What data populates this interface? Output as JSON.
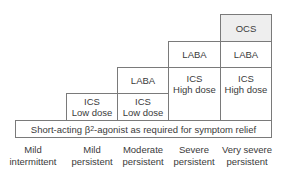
{
  "diagram": {
    "steps": [
      {
        "severity_line1": "Mild",
        "severity_line2": "intermittent",
        "treatments": []
      },
      {
        "severity_line1": "Mild",
        "severity_line2": "persistent",
        "treatments": [
          {
            "line1": "ICS",
            "line2": "Low dose"
          }
        ]
      },
      {
        "severity_line1": "Moderate",
        "severity_line2": "persistent",
        "treatments": [
          {
            "line1": "ICS",
            "line2": "Low dose"
          },
          {
            "line1": "LABA"
          }
        ]
      },
      {
        "severity_line1": "Severe",
        "severity_line2": "persistent",
        "treatments": [
          {
            "line1": "ICS",
            "line2": "High dose"
          },
          {
            "line1": "LABA"
          }
        ]
      },
      {
        "severity_line1": "Very severe",
        "severity_line2": "persistent",
        "treatments": [
          {
            "line1": "ICS",
            "line2": "High dose"
          },
          {
            "line1": "LABA"
          },
          {
            "line1": "OCS",
            "shaded": true
          }
        ]
      }
    ],
    "base_bar": {
      "prefix": "Short-acting β",
      "subscript": "2",
      "suffix": "-agonist as required for symptom relief"
    },
    "colors": {
      "border": "#7a7a7a",
      "shaded": "#eeeeee",
      "text": "#3a3a3a"
    }
  }
}
